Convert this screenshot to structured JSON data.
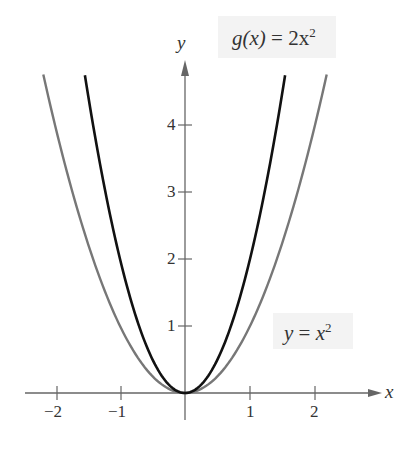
{
  "chart_data": {
    "type": "line",
    "title": "",
    "xlabel": "x",
    "ylabel": "y",
    "x_ticks": [
      "−2",
      "−1",
      "1",
      "2"
    ],
    "y_ticks": [
      "1",
      "2",
      "3",
      "4"
    ],
    "xlim": [
      -2.4,
      3.1
    ],
    "ylim": [
      0,
      4.8
    ],
    "grid": false,
    "series": [
      {
        "name": "y = x^2",
        "label": "y = x²",
        "formula": "x^2",
        "color": "#777777",
        "x": [
          -2.18,
          -2,
          -1.5,
          -1,
          -0.5,
          0,
          0.5,
          1,
          1.5,
          2,
          2.18
        ],
        "values": [
          4.75,
          4,
          2.25,
          1,
          0.25,
          0,
          0.25,
          1,
          2.25,
          4,
          4.75
        ]
      },
      {
        "name": "g(x) = 2x^2",
        "label": "g(x) = 2x²",
        "formula": "2x^2",
        "color": "#111111",
        "x": [
          -1.54,
          -1.5,
          -1,
          -0.5,
          0,
          0.5,
          1,
          1.5,
          1.54
        ],
        "values": [
          4.75,
          4.5,
          2,
          0.5,
          0,
          0.5,
          2,
          4.5,
          4.75
        ]
      }
    ]
  },
  "labels": {
    "g_label": {
      "lhs": "g(x)",
      "eq": "=",
      "rhs": "2x",
      "exp": "2"
    },
    "f_label": {
      "lhs": "y",
      "eq": "=",
      "rhs": "x",
      "exp": "2"
    },
    "x_axis": "x",
    "y_axis": "y",
    "xticks": [
      "−2",
      "−1",
      "1",
      "2"
    ],
    "yticks": [
      "1",
      "2",
      "3",
      "4"
    ]
  }
}
